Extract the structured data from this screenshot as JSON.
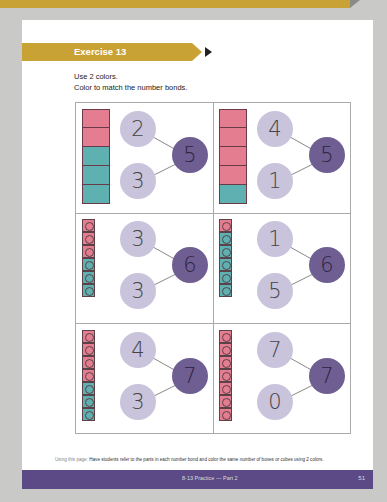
{
  "exercise": {
    "title": "Exercise 13",
    "instructions": [
      "Use 2 colors.",
      "Color to match the number bonds."
    ]
  },
  "colors": {
    "banner": "#c9a236",
    "pink": "#e47d8f",
    "teal": "#5fb0b0",
    "part_circle": "#c9c3dc",
    "whole_circle": "#6f5e92",
    "footer": "#5b4a85"
  },
  "cells": [
    {
      "type": "boxes",
      "part1": "2",
      "part2": "3",
      "whole": "5",
      "colored": [
        "pink",
        "pink",
        "teal",
        "teal",
        "teal"
      ]
    },
    {
      "type": "boxes",
      "part1": "4",
      "part2": "1",
      "whole": "5",
      "colored": [
        "pink",
        "pink",
        "pink",
        "pink",
        "teal"
      ]
    },
    {
      "type": "cubes",
      "part1": "3",
      "part2": "3",
      "whole": "6",
      "colored": [
        "pink",
        "pink",
        "pink",
        "teal",
        "teal",
        "teal"
      ]
    },
    {
      "type": "cubes",
      "part1": "1",
      "part2": "5",
      "whole": "6",
      "colored": [
        "pink",
        "teal",
        "teal",
        "teal",
        "teal",
        "teal"
      ]
    },
    {
      "type": "cubes",
      "part1": "4",
      "part2": "3",
      "whole": "7",
      "colored": [
        "pink",
        "pink",
        "pink",
        "pink",
        "teal",
        "teal",
        "teal"
      ]
    },
    {
      "type": "cubes",
      "part1": "7",
      "part2": "0",
      "whole": "7",
      "colored": [
        "pink",
        "pink",
        "pink",
        "pink",
        "pink",
        "pink",
        "pink"
      ]
    }
  ],
  "note": {
    "label": "Using this page:",
    "text": "Have students refer to the parts in each number bond and color the same number of boxes or cubes using 2 colors."
  },
  "footer": {
    "title": "8-13 Practice — Part 2",
    "page": "51"
  }
}
